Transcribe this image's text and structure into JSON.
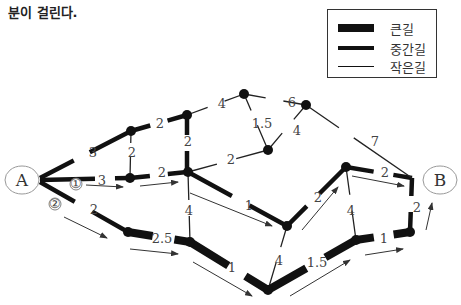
{
  "caption": "분이 걸린다.",
  "legend": {
    "items": [
      {
        "label": "큰길",
        "width": 8
      },
      {
        "label": "중간길",
        "width": 4
      },
      {
        "label": "작은길",
        "width": 1
      }
    ]
  },
  "endpoints": {
    "start": "A",
    "end": "B"
  },
  "route_markers": [
    "①",
    "②"
  ],
  "edges": [
    {
      "from": "A",
      "to": "N1",
      "weight": "3",
      "type": "medium"
    },
    {
      "from": "A",
      "to": "N5",
      "weight": "3",
      "type": "medium"
    },
    {
      "from": "A",
      "to": "N8",
      "weight": "2",
      "type": "medium"
    },
    {
      "from": "N1",
      "to": "N2",
      "weight": "2",
      "type": "medium"
    },
    {
      "from": "N1",
      "to": "N5",
      "weight": "2",
      "type": "small"
    },
    {
      "from": "N2",
      "to": "N3",
      "weight": "4",
      "type": "small"
    },
    {
      "from": "N2",
      "to": "N6",
      "weight": "2",
      "type": "medium"
    },
    {
      "from": "N3",
      "to": "N4",
      "weight": "6",
      "type": "small"
    },
    {
      "from": "N3",
      "to": "N7",
      "weight": "1.5",
      "type": "small"
    },
    {
      "from": "N7",
      "to": "N4",
      "weight": "4",
      "type": "small"
    },
    {
      "from": "N4",
      "to": "B",
      "weight": "7",
      "type": "small"
    },
    {
      "from": "N5",
      "to": "N6",
      "weight": "2",
      "type": "medium"
    },
    {
      "from": "N6",
      "to": "N7",
      "weight": "2",
      "type": "small"
    },
    {
      "from": "N6",
      "to": "N11",
      "weight": "1",
      "type": "medium"
    },
    {
      "from": "N6",
      "to": "N9",
      "weight": "4",
      "type": "small"
    },
    {
      "from": "N8",
      "to": "N9",
      "weight": "2.5",
      "type": "large"
    },
    {
      "from": "N9",
      "to": "N10",
      "weight": "1",
      "type": "large"
    },
    {
      "from": "N11",
      "to": "N10",
      "weight": "4",
      "type": "small"
    },
    {
      "from": "N11",
      "to": "N12",
      "weight": "2",
      "type": "medium"
    },
    {
      "from": "N12",
      "to": "B",
      "weight": "2",
      "type": "medium"
    },
    {
      "from": "N12",
      "to": "N13",
      "weight": "4",
      "type": "small"
    },
    {
      "from": "N10",
      "to": "N13",
      "weight": "1.5",
      "type": "large"
    },
    {
      "from": "N13",
      "to": "N14",
      "weight": "1",
      "type": "large"
    },
    {
      "from": "N14",
      "to": "B",
      "weight": "2",
      "type": "medium"
    }
  ]
}
